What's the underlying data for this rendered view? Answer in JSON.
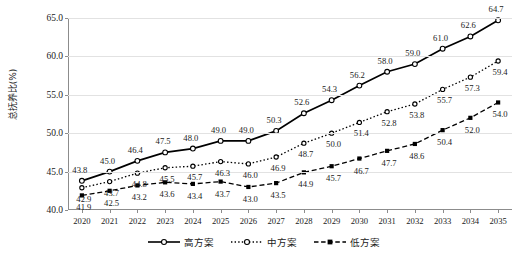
{
  "chart_data": {
    "type": "line",
    "title": "",
    "xlabel": "",
    "ylabel": "总抚养比(%)",
    "ylim": [
      40.0,
      65.0
    ],
    "ytick_values": [
      40.0,
      45.0,
      50.0,
      55.0,
      60.0,
      65.0
    ],
    "ytick_labels": [
      "40.0",
      "45.0",
      "50.0",
      "55.0",
      "60.0",
      "65.0"
    ],
    "grid": true,
    "legend_position": "bottom",
    "categories": [
      "2020",
      "2021",
      "2022",
      "2023",
      "2024",
      "2025",
      "2026",
      "2027",
      "2028",
      "2029",
      "2030",
      "2031",
      "2032",
      "2033",
      "2034",
      "2035"
    ],
    "series": [
      {
        "name": "高方案",
        "style": "solid",
        "marker": "open-circle",
        "values": [
          43.8,
          45.0,
          46.4,
          47.5,
          48.0,
          49.0,
          49.0,
          50.3,
          52.6,
          54.3,
          56.2,
          58.0,
          59.0,
          61.0,
          62.6,
          64.7
        ],
        "labels": [
          "43.8",
          "45.0",
          "46.4",
          "47.5",
          "48.0",
          "49.0",
          "49.0",
          "50.3",
          "52.6",
          "54.3",
          "56.2",
          "58.0",
          "59.0",
          "61.0",
          "62.6",
          "64.7"
        ]
      },
      {
        "name": "中方案",
        "style": "dotted",
        "marker": "open-circle",
        "values": [
          42.9,
          43.7,
          44.8,
          45.5,
          45.7,
          46.3,
          46.0,
          46.9,
          48.7,
          50.0,
          51.4,
          52.8,
          53.8,
          55.7,
          57.3,
          59.4
        ],
        "labels": [
          "42.9",
          "43.7",
          "44.8",
          "45.5",
          "45.7",
          "46.3",
          "46.0",
          "46.9",
          "48.7",
          "50.0",
          "51.4",
          "52.8",
          "53.8",
          "55.7",
          "57.3",
          "59.4"
        ]
      },
      {
        "name": "低方案",
        "style": "dashed",
        "marker": "filled-square",
        "values": [
          41.9,
          42.5,
          43.2,
          43.6,
          43.4,
          43.7,
          43.0,
          43.5,
          44.9,
          45.7,
          46.7,
          47.7,
          48.6,
          50.4,
          52.0,
          54.0
        ],
        "labels": [
          "41.9",
          "42.5",
          "43.2",
          "43.6",
          "43.4",
          "43.7",
          "43.0",
          "43.5",
          "44.9",
          "45.7",
          "46.7",
          "47.7",
          "48.6",
          "50.4",
          "52.0",
          "54.0"
        ]
      }
    ],
    "colors": {
      "line": "#000000",
      "grid": "#e2e2e2",
      "axis": "#8c8c8c",
      "text": "#1a1a1a",
      "background": "#ffffff"
    }
  }
}
